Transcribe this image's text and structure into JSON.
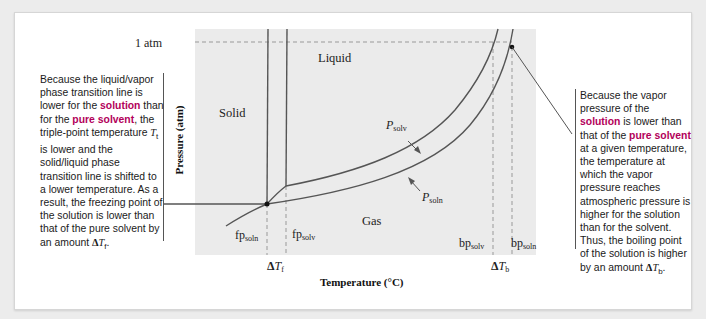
{
  "figure": {
    "axes": {
      "x_label": "Temperature (°C)",
      "y_label": "Pressure (atm)",
      "y_tick": "1 atm"
    },
    "regions": {
      "solid": "Solid",
      "liquid": "Liquid",
      "gas": "Gas"
    },
    "curves": {
      "solvent_label_main": "P",
      "solvent_label_sub": "solv",
      "solution_label_main": "P",
      "solution_label_sub": "soln"
    },
    "markers": {
      "fp_soln_main": "fp",
      "fp_soln_sub": "soln",
      "fp_solv_main": "fp",
      "fp_solv_sub": "solv",
      "bp_solv_main": "bp",
      "bp_solv_sub": "solv",
      "bp_soln_main": "bp",
      "bp_soln_sub": "soln",
      "delta_tf_delta": "Δ",
      "delta_tf_T": "T",
      "delta_tf_sub": "f",
      "delta_tb_delta": "Δ",
      "delta_tb_T": "T",
      "delta_tb_sub": "b"
    },
    "notes": {
      "left": {
        "p1": "Because the liquid/vapor phase transition line is lower for the ",
        "em1": "solution",
        "p2": " than for the ",
        "em2": "pure solvent",
        "p3": ", the triple-point temperature ",
        "t": "T",
        "t_sub": "t",
        "p4": "  is lower and the solid/liquid phase transition line is shifted to a lower temperature. As a result, the freezing point of the solution is lower than that of the pure solvent by an amount ",
        "delta": "Δ",
        "dt": "T",
        "dt_sub": "f",
        "end": "."
      },
      "right": {
        "p1": "Because the vapor pressure of the ",
        "em1": "solution",
        "p2": " is lower than that of the ",
        "em2": "pure solvent",
        "p3": " at a given temperature, the temperature at which the vapor pressure reaches atmospheric pressure is higher for the solution than for the solvent. Thus, the boiling point of the solution is higher by an amount ",
        "delta": "Δ",
        "dt": "T",
        "dt_sub": "b",
        "end": "."
      }
    },
    "colors": {
      "plot_background": "#ebebeb",
      "line": "#555555",
      "highlight_text": "#b3005a"
    }
  }
}
